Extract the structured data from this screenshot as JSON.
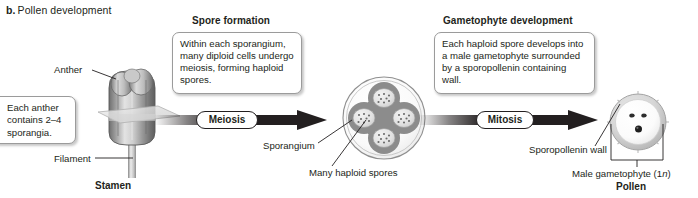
{
  "panel": {
    "letter": "b.",
    "title": "Pollen development"
  },
  "headings": {
    "spore_formation": "Spore formation",
    "gametophyte_development": "Gametophyte development"
  },
  "callouts": {
    "anther": "Each anther contains 2–4 sporangia.",
    "spore_formation": "Within each sporangium, many diploid cells undergo meiosis, forming haploid spores.",
    "gametophyte_development": "Each haploid spore develops into a male gametophyte surrounded by a sporopollenin containing wall."
  },
  "arrows": {
    "meiosis": "Meiosis",
    "mitosis": "Mitosis"
  },
  "labels": {
    "anther": "Anther",
    "filament": "Filament",
    "sporangium": "Sporangium",
    "many_haploid_spores": "Many haploid spores",
    "sporopollenin_wall": "Sporopollenin wall",
    "male_gametophyte": "Male gametophyte (1n)",
    "male_gametophyte_plain": "Male gametophyte (1",
    "male_gametophyte_italic": "n",
    "male_gametophyte_close": ")"
  },
  "structures": {
    "stamen": "Stamen",
    "pollen": "Pollen"
  },
  "art": {
    "sporangium_spore_count": 4,
    "pollen_nuclei_count": 3
  },
  "colors": {
    "ink": "#231f20",
    "arrow": "#231f20",
    "box_border": "#9b9b9b",
    "tissue_dark": "#8b8b8b",
    "tissue_light": "#d9d9d9",
    "page_background": "#ffffff"
  }
}
